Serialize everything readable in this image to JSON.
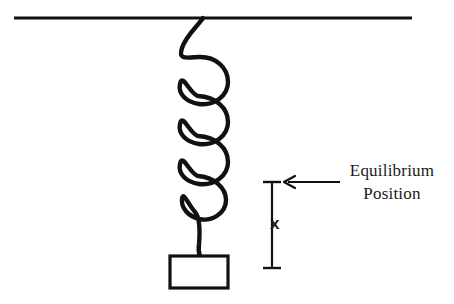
{
  "figure": {
    "background_color": "#ffffff",
    "ink_color": "#111111"
  },
  "ceiling": {
    "name": "support-ceiling-line",
    "x_start": 14,
    "x_end": 412,
    "y": 18,
    "thickness": 3.2
  },
  "spring": {
    "name": "helical-spring",
    "coil_count": 4,
    "attachment_x": 203,
    "attachment_y": 18,
    "axis_x": 185,
    "loop_right_x": 222,
    "first_loop_top_y": 58,
    "last_loop_bottom_y": 210,
    "stroke_width": 4.4,
    "bottom_contact_y": 257
  },
  "mass": {
    "name": "hanging-mass-block",
    "x": 170,
    "y": 256,
    "width": 58,
    "height": 32,
    "stroke_width": 3.2,
    "fill": "#ffffff"
  },
  "measure": {
    "name": "displacement-measure-bar",
    "x": 272,
    "top_y": 182,
    "bottom_y": 268,
    "cap_half_width": 9,
    "stroke_width": 2.2,
    "label": "x"
  },
  "annotation": {
    "name": "equilibrium-annotation",
    "arrow": {
      "tail_x": 340,
      "head_x": 284,
      "y": 182,
      "stroke_width": 1.8,
      "head_size": 9
    },
    "text_line_1": "Equilibrium",
    "text_line_2": "Position"
  }
}
